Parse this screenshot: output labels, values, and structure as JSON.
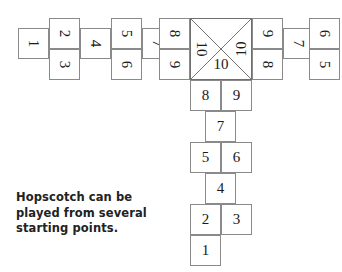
{
  "diagram": {
    "caption": {
      "line1": "Hopscotch can be",
      "line2": "played from several",
      "line3": "starting points."
    },
    "colors": {
      "background": "#ffffff",
      "cell_border": "#8a8a8a",
      "center_border": "#6f6f6f",
      "number": "#1a1a1a",
      "caption": "#222222"
    },
    "center_square": {
      "label_top": "",
      "label_left": "10",
      "label_right": "10",
      "label_bottom": "10"
    },
    "left_arm": {
      "cell_1": "1",
      "cell_2": "2",
      "cell_3": "3",
      "cell_4": "4",
      "cell_5": "5",
      "cell_6": "6",
      "cell_8": "8",
      "cell_9": "9"
    },
    "right_arm": {
      "cell_9": "9",
      "cell_8": "8",
      "cell_7": "7",
      "cell_6": "6",
      "cell_5": "5"
    },
    "bottom_arm": {
      "cell_8": "8",
      "cell_9": "9",
      "cell_7": "7",
      "cell_5": "5",
      "cell_6": "6",
      "cell_4": "4",
      "cell_2": "2",
      "cell_3": "3",
      "cell_1": "1"
    }
  }
}
